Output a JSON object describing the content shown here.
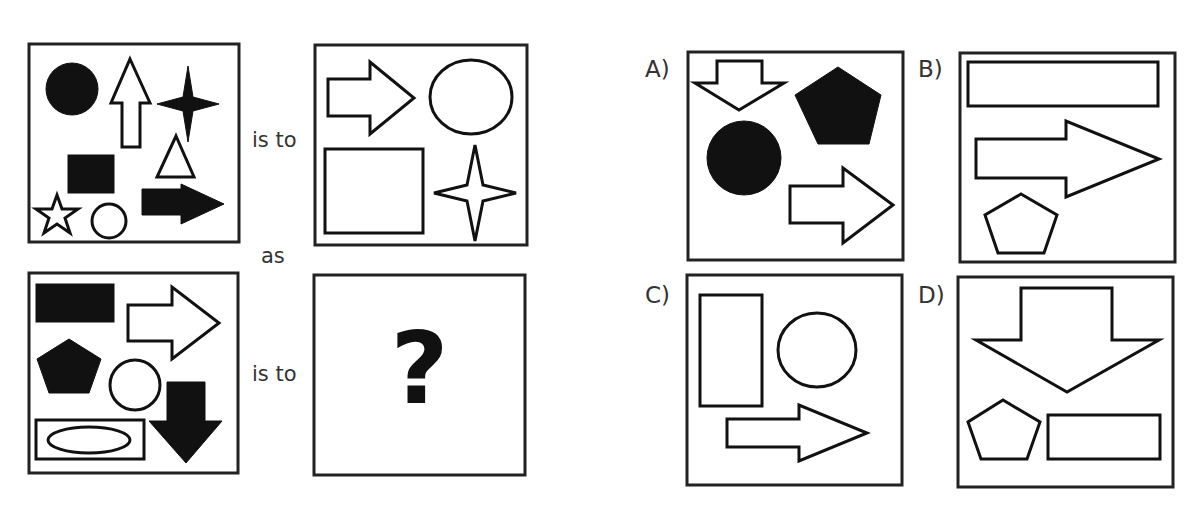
{
  "puzzle": {
    "connectors": {
      "is_to_top": "is to",
      "as": "as",
      "is_to_bottom": "is to"
    },
    "unknown_mark": "?",
    "panels": {
      "top_left": {
        "shapes": [
          "filled-circle",
          "outline-up-arrow",
          "filled-four-point-star",
          "outline-triangle",
          "filled-square",
          "outline-star",
          "outline-circle",
          "filled-right-arrow"
        ]
      },
      "top_right": {
        "shapes": [
          "outline-right-arrow",
          "outline-circle",
          "outline-square",
          "outline-four-point-star"
        ]
      },
      "bottom_left": {
        "shapes": [
          "filled-rectangle",
          "outline-right-arrow",
          "filled-pentagon",
          "outline-circle",
          "filled-down-arrow",
          "outline-rectangle",
          "outline-ellipse"
        ]
      },
      "bottom_right": {
        "content": "?"
      }
    },
    "options": [
      {
        "label": "A)",
        "shapes": [
          "outline-down-arrow",
          "filled-pentagon",
          "filled-circle",
          "outline-right-arrow"
        ]
      },
      {
        "label": "B)",
        "shapes": [
          "outline-rectangle",
          "outline-right-arrow",
          "outline-pentagon"
        ]
      },
      {
        "label": "C)",
        "shapes": [
          "outline-rectangle",
          "outline-circle",
          "outline-right-arrow"
        ]
      },
      {
        "label": "D)",
        "shapes": [
          "outline-down-arrow",
          "outline-pentagon",
          "outline-rectangle"
        ]
      }
    ]
  }
}
